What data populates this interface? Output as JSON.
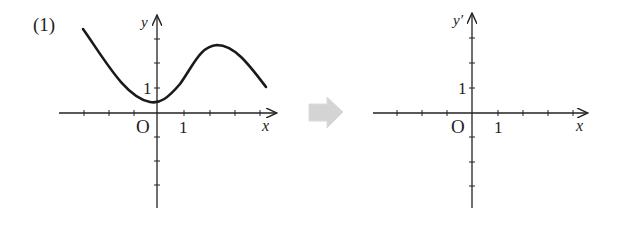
{
  "problem": {
    "number_label": "(1)"
  },
  "left_graph": {
    "y_axis_label": "y",
    "x_axis_label": "x",
    "origin_label": "O",
    "x_unit_label": "1",
    "y_unit_label": "1",
    "curve_description": "graph of y = f(x): decreasing to a local minimum near x=0 (y≈0.4), increasing to a local maximum near x≈2.4 (y≈2.7), then decreasing"
  },
  "transform_arrow": {
    "icon": "right-arrow-icon",
    "color": "#d0d0d0"
  },
  "right_graph": {
    "y_axis_label": "y′",
    "x_axis_label": "x",
    "origin_label": "O",
    "x_unit_label": "1",
    "y_unit_label": "1",
    "curve_description": "empty axes for sketching y′ = f′(x)"
  },
  "colors": {
    "ink": "#222222",
    "arrow": "#d0d0d0",
    "background": "#ffffff"
  }
}
